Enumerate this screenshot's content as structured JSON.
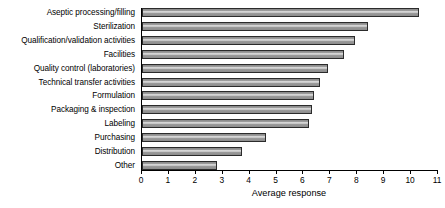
{
  "chart_data": {
    "type": "bar",
    "orientation": "horizontal",
    "title": "",
    "xlabel": "Average response",
    "ylabel": "",
    "xlim": [
      0,
      11
    ],
    "xticks": [
      0,
      1,
      2,
      3,
      4,
      5,
      6,
      7,
      8,
      9,
      10,
      11
    ],
    "grid": false,
    "legend": false,
    "categories": [
      "Aseptic processing/filling",
      "Sterilization",
      "Qualification/validation activities",
      "Facilities",
      "Quality control (laboratories)",
      "Technical transfer activities",
      "Formulation",
      "Packaging & inspection",
      "Labeling",
      "Purchasing",
      "Distribution",
      "Other"
    ],
    "values": [
      10.3,
      8.4,
      7.9,
      7.5,
      6.9,
      6.6,
      6.4,
      6.3,
      6.2,
      4.6,
      3.7,
      2.8
    ],
    "bar_style": {
      "fill": "#a8a8a8",
      "edge": "#2b2b2b",
      "pattern": "horizontal-gradient-shading"
    }
  }
}
